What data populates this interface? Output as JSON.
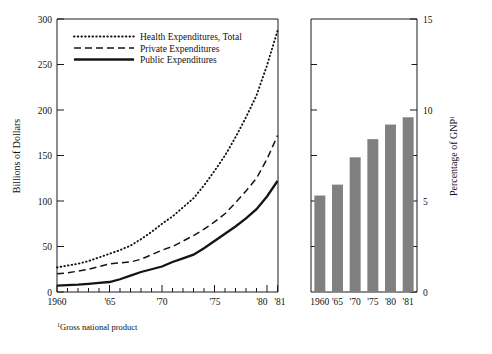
{
  "figure": {
    "footnote_marker": "1",
    "footnote_text": "Gross national product"
  },
  "chart_data": [
    {
      "type": "line",
      "title": "",
      "xlabel": "",
      "ylabel": "Billions of Dollars",
      "xlim": [
        1960,
        1981
      ],
      "ylim": [
        0,
        300
      ],
      "grid": false,
      "legend_position": "upper-left",
      "xticks_major": [
        1960,
        1965,
        1970,
        1975,
        1980,
        1981
      ],
      "xticklabels": [
        "1960",
        "'65",
        "'70",
        "'75",
        "'80",
        "'81"
      ],
      "yticks": [
        0,
        50,
        100,
        150,
        200,
        250,
        300
      ],
      "yticklabels": [
        "0",
        "50",
        "100",
        "150",
        "200",
        "250",
        "300"
      ],
      "x": [
        1960,
        1961,
        1962,
        1963,
        1964,
        1965,
        1966,
        1967,
        1968,
        1969,
        1970,
        1971,
        1972,
        1973,
        1974,
        1975,
        1976,
        1977,
        1978,
        1979,
        1980,
        1981
      ],
      "series": [
        {
          "name": "Health Expenditures, Total",
          "style": "dotted",
          "values": [
            27,
            29,
            31,
            34,
            38,
            42,
            46,
            51,
            58,
            66,
            75,
            83,
            93,
            103,
            117,
            133,
            150,
            170,
            192,
            216,
            249,
            287
          ]
        },
        {
          "name": "Private Expenditures",
          "style": "dashed",
          "values": [
            20,
            21,
            23,
            25,
            28,
            31,
            32,
            33,
            36,
            41,
            46,
            50,
            56,
            62,
            69,
            77,
            86,
            98,
            111,
            125,
            146,
            172
          ]
        },
        {
          "name": "Public Expenditures",
          "style": "solid",
          "values": [
            7,
            7.5,
            8,
            9,
            10,
            11,
            14,
            18,
            22,
            25,
            28,
            33,
            37,
            41,
            48,
            56,
            64,
            72,
            81,
            91,
            105,
            122
          ]
        }
      ]
    },
    {
      "type": "bar",
      "title": "",
      "xlabel": "",
      "ylabel": "Percentage of GNP",
      "ylabel_sup": "1",
      "ylim": [
        0,
        15
      ],
      "grid": false,
      "yticks": [
        0,
        5,
        10,
        15
      ],
      "yticklabels": [
        "0",
        "5",
        "10",
        "15"
      ],
      "categories": [
        "1960",
        "'65",
        "'70",
        "'75",
        "'80",
        "'81"
      ],
      "values": [
        5.3,
        5.9,
        7.4,
        8.4,
        9.2,
        9.6
      ],
      "bar_color": "#808080"
    }
  ]
}
